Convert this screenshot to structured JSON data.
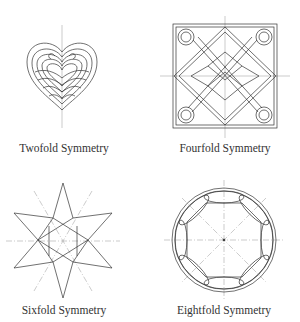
{
  "figures": [
    {
      "id": "twofold",
      "caption": "Twofold Symmetry",
      "motif": "heart-spiral"
    },
    {
      "id": "fourfold",
      "caption": "Fourfold Symmetry",
      "motif": "celtic-knot-square"
    },
    {
      "id": "sixfold",
      "caption": "Sixfold Symmetry",
      "motif": "six-point-star"
    },
    {
      "id": "eightfold",
      "caption": "Eightfold Symmetry",
      "motif": "circle-eight-lobes"
    }
  ],
  "colors": {
    "line": "#333333",
    "axis": "#999999",
    "background": "#ffffff"
  }
}
